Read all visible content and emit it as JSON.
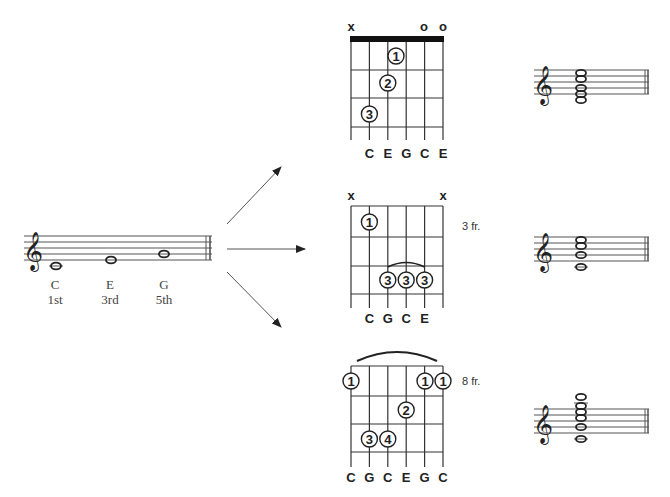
{
  "arpeggio": {
    "notes": [
      {
        "name": "C",
        "degree": "1st"
      },
      {
        "name": "E",
        "degree": "3rd"
      },
      {
        "name": "G",
        "degree": "5th"
      }
    ]
  },
  "chords": [
    {
      "id": "open-c",
      "top_markers": [
        "x",
        "",
        "",
        "",
        "o",
        "o"
      ],
      "fret_label": "",
      "fingers": [
        {
          "string": 4,
          "fret": 1,
          "finger": "1"
        },
        {
          "string": 2,
          "fret": 2,
          "finger": "2"
        },
        {
          "string": 1,
          "fret": 3,
          "finger": "3"
        }
      ],
      "string_labels": [
        "",
        "C",
        "E",
        "G",
        "C",
        "E"
      ]
    },
    {
      "id": "c-3rd-fret",
      "top_markers": [
        "x",
        "",
        "",
        "",
        "",
        "x"
      ],
      "fret_label": "3 fr.",
      "fingers": [
        {
          "string": 1,
          "fret": 1,
          "finger": "1"
        },
        {
          "string": 2,
          "fret": 3,
          "finger": "3"
        },
        {
          "string": 3,
          "fret": 3,
          "finger": "3"
        },
        {
          "string": 4,
          "fret": 3,
          "finger": "3"
        }
      ],
      "string_labels": [
        "",
        "C",
        "G",
        "C",
        "E",
        ""
      ]
    },
    {
      "id": "c-8th-fret",
      "top_markers": [
        "",
        "",
        "",
        "",
        "",
        ""
      ],
      "fret_label": "8 fr.",
      "fingers": [
        {
          "string": 0,
          "fret": 1,
          "finger": "1"
        },
        {
          "string": 4,
          "fret": 1,
          "finger": "1"
        },
        {
          "string": 5,
          "fret": 1,
          "finger": "1"
        },
        {
          "string": 3,
          "fret": 2,
          "finger": "2"
        },
        {
          "string": 1,
          "fret": 3,
          "finger": "3"
        },
        {
          "string": 2,
          "fret": 3,
          "finger": "4"
        }
      ],
      "string_labels": [
        "C",
        "G",
        "C",
        "E",
        "G",
        "C"
      ]
    }
  ],
  "labels": {
    "open_c": {
      "x": "x",
      "o": "o",
      "f1": "1",
      "f2": "2",
      "f3": "3",
      "s": [
        "C",
        "E",
        "G",
        "C",
        "E"
      ]
    },
    "c3": {
      "x": "x",
      "fr": "3 fr.",
      "f1": "1",
      "f3": "3",
      "s": [
        "C",
        "G",
        "C",
        "E"
      ]
    },
    "c8": {
      "fr": "8 fr.",
      "f1": "1",
      "f2": "2",
      "f3": "3",
      "f4": "4",
      "s": [
        "C",
        "G",
        "C",
        "E",
        "G",
        "C"
      ]
    }
  }
}
